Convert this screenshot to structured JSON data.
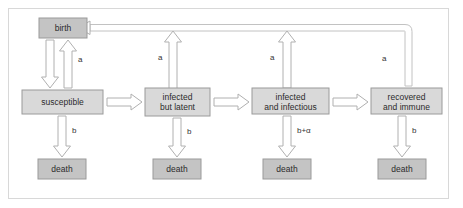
{
  "figure": {
    "border_color": "#d8d8d8",
    "background_color": "#ffffff"
  },
  "palette": {
    "state_fill": "#d9d9d9",
    "terminal_fill": "#c4c4c4",
    "box_stroke": "#9a9a9a",
    "arrow_fill": "#ffffff",
    "arrow_stroke": "#b0b0b0",
    "text_color": "#2b2b2b"
  },
  "nodes": {
    "birth": {
      "label": "birth",
      "kind": "terminal"
    },
    "susceptible": {
      "label": "susceptible",
      "kind": "state"
    },
    "latent": {
      "line1": "infected",
      "line2": "but latent",
      "kind": "state"
    },
    "infectious": {
      "line1": "infected",
      "line2": "and infectious",
      "kind": "state"
    },
    "recovered": {
      "line1": "recovered",
      "line2": "and immune",
      "kind": "state"
    },
    "death_1": {
      "label": "death",
      "kind": "terminal"
    },
    "death_2": {
      "label": "death",
      "kind": "terminal"
    },
    "death_3": {
      "label": "death",
      "kind": "terminal"
    },
    "death_4": {
      "label": "death",
      "kind": "terminal"
    }
  },
  "edge_labels": {
    "birth_rate_1": "a",
    "birth_rate_2": "a",
    "birth_rate_3": "a",
    "birth_rate_4": "a",
    "death_rate_1": "b",
    "death_rate_2": "b",
    "death_rate_3": "b+α",
    "death_rate_4": "b"
  }
}
